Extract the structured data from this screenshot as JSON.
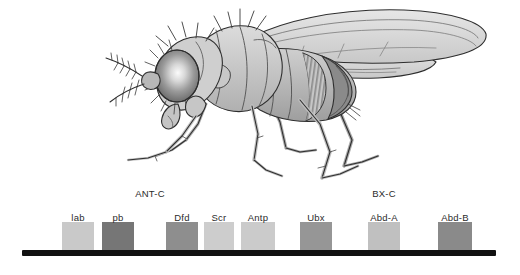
{
  "figure": {
    "organism_illustration": "drosophila-fly-lateral-view",
    "background_color": "#ffffff"
  },
  "chromosome": {
    "line_color": "#111111",
    "x_start": 22,
    "x_end": 496,
    "y": 250,
    "thickness": 6
  },
  "complexes": [
    {
      "name": "ANT-C",
      "label": "ANT-C",
      "center_x": 150,
      "label_y": 190,
      "genes": [
        "lab",
        "pb",
        "Dfd",
        "Scr",
        "Antp"
      ]
    },
    {
      "name": "BX-C",
      "label": "BX-C",
      "center_x": 384,
      "label_y": 190,
      "genes": [
        "Ubx",
        "Abd-A",
        "Abd-B"
      ]
    }
  ],
  "genes": [
    {
      "label": "lab",
      "x": 62,
      "width": 32,
      "height": 28,
      "color": "#c9c9c9",
      "label_center_x": 78,
      "label_y": 216,
      "complex": "ANT-C"
    },
    {
      "label": "pb",
      "x": 102,
      "width": 32,
      "height": 28,
      "color": "#767676",
      "label_center_x": 118,
      "label_y": 216,
      "complex": "ANT-C"
    },
    {
      "label": "Dfd",
      "x": 166,
      "width": 32,
      "height": 28,
      "color": "#8e8e8e",
      "label_center_x": 182,
      "label_y": 216,
      "complex": "ANT-C"
    },
    {
      "label": "Scr",
      "x": 204,
      "width": 30,
      "height": 28,
      "color": "#cdcdcd",
      "label_center_x": 219,
      "label_y": 216,
      "complex": "ANT-C"
    },
    {
      "label": "Antp",
      "x": 241,
      "width": 34,
      "height": 28,
      "color": "#cbcbcb",
      "label_center_x": 258,
      "label_y": 216,
      "complex": "ANT-C"
    },
    {
      "label": "Ubx",
      "x": 300,
      "width": 32,
      "height": 28,
      "color": "#969696",
      "label_center_x": 316,
      "label_y": 216,
      "complex": "BX-C"
    },
    {
      "label": "Abd-A",
      "x": 368,
      "width": 32,
      "height": 28,
      "color": "#c0c0c0",
      "label_center_x": 384,
      "label_y": 216,
      "complex": "BX-C"
    },
    {
      "label": "Abd-B",
      "x": 438,
      "width": 34,
      "height": 28,
      "color": "#8a8a8a",
      "label_center_x": 455,
      "label_y": 216,
      "complex": "BX-C"
    }
  ],
  "fly": {
    "alt": "Lateral view line drawing of an adult Drosophila fly, head at left with large compound eye, segmented abdomen at right, two wings extending to the upper right, six legs below",
    "parts": [
      "compound-eye",
      "antenna",
      "head",
      "thorax",
      "abdomen",
      "wing-upper",
      "wing-lower",
      "legs",
      "halteres"
    ],
    "palette": {
      "outline": "#2e2e2e",
      "body_light": "#d2d2d2",
      "body_mid": "#b4b4b4",
      "body_dark": "#8c8c8c",
      "eye_dark": "#6e6e6e",
      "eye_highlight": "#f2f2f2",
      "wing": "#dcdcdc"
    }
  }
}
